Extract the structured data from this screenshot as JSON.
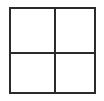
{
  "figure": {
    "name": "grid-2x2",
    "shape": "square",
    "rows": 2,
    "columns": 2,
    "cell_count": 4,
    "stroke_color": "#2b2b2b",
    "fill_color": "#ffffff",
    "background_color": "#ffffff",
    "stroke_width_px": 2,
    "outer_width_px": 87,
    "outer_height_px": 87,
    "offset_left_px": 9,
    "offset_top_px": 7,
    "divider_vertical_px": 43,
    "divider_horizontal_px": 43,
    "cells": [
      {
        "id": "top-left",
        "label": "",
        "row": 1,
        "column": 1,
        "fill": "#ffffff"
      },
      {
        "id": "top-right",
        "label": "",
        "row": 1,
        "column": 2,
        "fill": "#ffffff"
      },
      {
        "id": "bottom-left",
        "label": "",
        "row": 2,
        "column": 1,
        "fill": "#ffffff"
      },
      {
        "id": "bottom-right",
        "label": "",
        "row": 2,
        "column": 2,
        "fill": "#ffffff"
      }
    ]
  },
  "canvas": {
    "width_px": 104,
    "height_px": 101,
    "background_color": "#ffffff"
  }
}
